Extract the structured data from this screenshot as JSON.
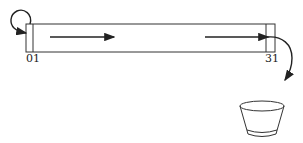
{
  "diagram": {
    "register": {
      "first_cell_labels": [
        "0",
        "1"
      ],
      "last_cell_label": "31"
    },
    "arrows": [
      {
        "name": "loop-arrow",
        "from": "bit 0 (top)",
        "to": "bit 0 (side)"
      },
      {
        "name": "shift-arrow-1",
        "direction": "right"
      },
      {
        "name": "shift-arrow-2",
        "direction": "right"
      },
      {
        "name": "spill-arrow",
        "from": "bit 31",
        "to": "bucket"
      }
    ],
    "bucket": {
      "name": "discard-bucket"
    },
    "colors": {
      "ink": "#222222",
      "background": "#ffffff"
    }
  }
}
